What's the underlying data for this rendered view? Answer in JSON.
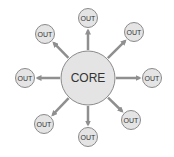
{
  "diagram": {
    "core": {
      "label": "CORE",
      "cx": 88,
      "cy": 78,
      "r": 27
    },
    "outputs": [
      {
        "label": "OUT",
        "position": "top",
        "cx": 88,
        "cy": 18
      },
      {
        "label": "OUT",
        "position": "top-right",
        "cx": 134,
        "cy": 32
      },
      {
        "label": "OUT",
        "position": "right",
        "cx": 152,
        "cy": 78
      },
      {
        "label": "OUT",
        "position": "bottom-right",
        "cx": 131,
        "cy": 120
      },
      {
        "label": "OUT",
        "position": "bottom",
        "cx": 88,
        "cy": 137
      },
      {
        "label": "OUT",
        "position": "bottom-left",
        "cx": 44,
        "cy": 124
      },
      {
        "label": "OUT",
        "position": "left",
        "cx": 25,
        "cy": 78
      },
      {
        "label": "OUT",
        "position": "top-left",
        "cx": 45,
        "cy": 34
      }
    ],
    "colors": {
      "node_fill": "#e4e4e4",
      "node_stroke": "#8a8a8a",
      "arrow": "#8f8f8f",
      "text": "#333333"
    }
  }
}
